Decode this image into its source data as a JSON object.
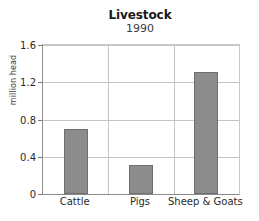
{
  "chart_data": {
    "type": "bar",
    "title": "Livestock",
    "subtitle": "1990",
    "categories": [
      "Cattle",
      "Pigs",
      "Sheep & Goats"
    ],
    "values": [
      0.7,
      0.31,
      1.31
    ],
    "xlabel": "",
    "ylabel": "million head",
    "ylim": [
      0,
      1.6
    ],
    "yticks": [
      "0",
      "0.4",
      "0.8",
      "1.2",
      "1.6"
    ],
    "ytick_values": [
      0,
      0.4,
      0.8,
      1.2,
      1.6
    ],
    "grid": "horizontal-and-category-separators",
    "legend": "none",
    "bar_color": "#8c8c8c",
    "bar_edge_color": "#6e6e6e",
    "grid_color": "#c4c4c4",
    "axis_color": "#8a8a8a",
    "background_color": "#ffffff"
  }
}
